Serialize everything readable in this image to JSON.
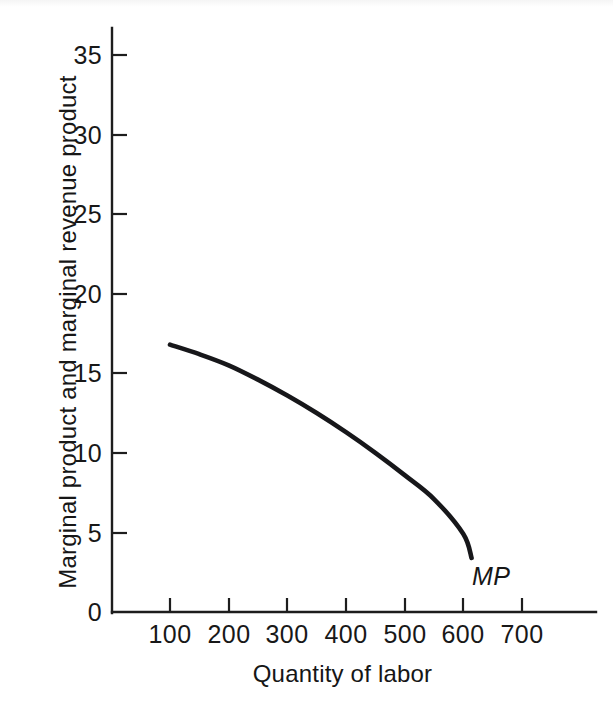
{
  "chart_data": {
    "type": "line",
    "title": "",
    "xlabel": "Quantity of labor",
    "ylabel": "Marginal product and marginal revenue product",
    "xlim": [
      0,
      780
    ],
    "ylim": [
      0,
      37
    ],
    "xticks": [
      100,
      200,
      300,
      400,
      500,
      600,
      700
    ],
    "xtick_labels": [
      "100",
      "200",
      "300",
      "400",
      "500",
      "600",
      "700"
    ],
    "yticks": [
      0,
      5,
      10,
      15,
      20,
      25,
      30,
      35
    ],
    "ytick_labels": [
      "0",
      "5",
      "10",
      "15",
      "20",
      "25",
      "30",
      "35"
    ],
    "grid": false,
    "legend_position": "inline-end-of-curve",
    "series": [
      {
        "name": "MP",
        "label": "MP",
        "label_style": "italic",
        "color": "#17171a",
        "x": [
          100,
          150,
          200,
          250,
          300,
          350,
          400,
          450,
          500,
          550,
          600,
          614
        ],
        "y": [
          16.8,
          16.2,
          15.5,
          14.6,
          13.6,
          12.5,
          11.3,
          10.0,
          8.6,
          7.1,
          4.9,
          3.4
        ]
      }
    ],
    "annotations": [
      {
        "text": "MP",
        "x": 620,
        "y": 2.6,
        "style": "italic"
      }
    ]
  },
  "axes": {
    "y_axis_name": "marginal-product-axis",
    "x_axis_name": "quantity-of-labor-axis"
  }
}
